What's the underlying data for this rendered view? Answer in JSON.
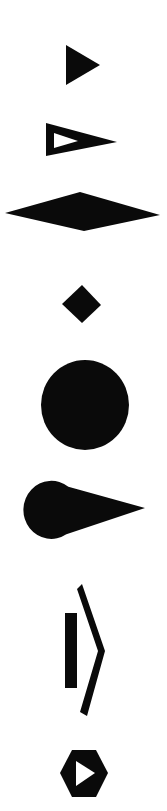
{
  "canvas": {
    "width": 167,
    "height": 811,
    "background_color": "#ffffff",
    "foreground_color": "#000000",
    "title": "Shape Glyph Strip"
  },
  "shapes": [
    {
      "id": "solid-right-triangle",
      "label": "Solid right-pointing triangle",
      "fill": "#0a0a0a",
      "bbox": [
        66,
        45,
        34,
        40
      ],
      "points": "66,45 100,65 66,85"
    },
    {
      "id": "pennant-triangle-with-hole",
      "label": "Right-pointing pennant triangle with triangular cutout",
      "fill": "#0a0a0a",
      "hole_fill": "#ffffff",
      "bbox": [
        46,
        123,
        71,
        33
      ],
      "points": "46,123 117,142 46,156",
      "hole_points": "54,133 78,141 54,148"
    },
    {
      "id": "wide-rhombus",
      "label": "Wide flat diamond",
      "fill": "#0a0a0a",
      "bbox": [
        5,
        192,
        155,
        39
      ],
      "points": "80,192 160,215 84,231 5,213"
    },
    {
      "id": "small-diamond",
      "label": "Small diamond",
      "fill": "#0a0a0a",
      "bbox": [
        62,
        285,
        39,
        38
      ],
      "points": "82,285 101,305 82,323 62,304"
    },
    {
      "id": "filled-circle",
      "label": "Filled circle",
      "fill": "#0a0a0a",
      "center": [
        85,
        405
      ],
      "rx": 44,
      "ry": 45
    },
    {
      "id": "teardrop-cone",
      "label": "Teardrop cone pointing right",
      "fill": "#0a0a0a",
      "bbox": [
        23,
        480,
        122,
        60
      ],
      "bulb_center": [
        51,
        510
      ],
      "bulb_rx": 28,
      "bulb_ry": 29,
      "tip": [
        145,
        508
      ]
    },
    {
      "id": "vertical-bar",
      "label": "Vertical bar",
      "fill": "#0a0a0a",
      "bbox": [
        65,
        613,
        12,
        75
      ]
    },
    {
      "id": "chevron-right-stroke",
      "label": "Tall right-pointing chevron stroke",
      "fill": "#0a0a0a",
      "bbox": [
        82,
        584,
        23,
        132
      ],
      "points": "82,584 105,651 87,716 80,712 98,651 77,589"
    },
    {
      "id": "hexagon-play-badge",
      "label": "Hexagon badge with play triangle",
      "fill": "#0a0a0a",
      "glyph_fill": "#ffffff",
      "bbox": [
        60,
        750,
        48,
        47
      ],
      "hex_points": "72,750 96,750 108,773 96,797 72,797 60,773",
      "play_points": "76,761 95,773 76,786"
    }
  ]
}
